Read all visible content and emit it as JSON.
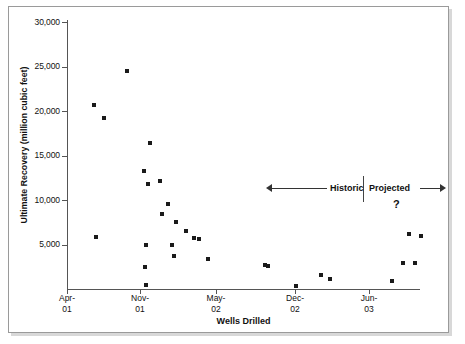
{
  "chart_data": {
    "type": "scatter",
    "title": "",
    "xlabel": "Wells Drilled",
    "ylabel": "Ultimate Recovery (million cubic feet)",
    "ylim": [
      0,
      30000
    ],
    "ytick_labels": [
      "30,000",
      "25,000",
      "20,000",
      "15,000",
      "10,000",
      "5,000"
    ],
    "ytick_values": [
      30000,
      25000,
      20000,
      15000,
      10000,
      5000
    ],
    "xtick_labels": [
      {
        "line1": "Apr-",
        "line2": "01"
      },
      {
        "line1": "Nov-",
        "line2": "01"
      },
      {
        "line1": "May-",
        "line2": "02"
      },
      {
        "line1": "Dec-",
        "line2": "02"
      },
      {
        "line1": "Jun-",
        "line2": "03"
      }
    ],
    "grid": false,
    "legend": null,
    "series": [
      {
        "name": "Ultimate Recovery per well",
        "points": [
          {
            "x_px": 94,
            "value": 20700
          },
          {
            "x_px": 104,
            "value": 19200
          },
          {
            "x_px": 127,
            "value": 24500
          },
          {
            "x_px": 96,
            "value": 5800
          },
          {
            "x_px": 150,
            "value": 16400
          },
          {
            "x_px": 144,
            "value": 13300
          },
          {
            "x_px": 148,
            "value": 11800
          },
          {
            "x_px": 160,
            "value": 12100
          },
          {
            "x_px": 146,
            "value": 5000
          },
          {
            "x_px": 145,
            "value": 2500
          },
          {
            "x_px": 146,
            "value": 400
          },
          {
            "x_px": 168,
            "value": 9500
          },
          {
            "x_px": 162,
            "value": 8400
          },
          {
            "x_px": 172,
            "value": 5000
          },
          {
            "x_px": 176,
            "value": 7500
          },
          {
            "x_px": 174,
            "value": 3700
          },
          {
            "x_px": 186,
            "value": 6500
          },
          {
            "x_px": 194,
            "value": 5700
          },
          {
            "x_px": 199,
            "value": 5600
          },
          {
            "x_px": 208,
            "value": 3400
          },
          {
            "x_px": 265,
            "value": 2700
          },
          {
            "x_px": 268,
            "value": 2600
          },
          {
            "x_px": 296,
            "value": 300
          },
          {
            "x_px": 321,
            "value": 1600
          },
          {
            "x_px": 330,
            "value": 1100
          },
          {
            "x_px": 392,
            "value": 900
          },
          {
            "x_px": 403,
            "value": 2900
          },
          {
            "x_px": 415,
            "value": 2900
          },
          {
            "x_px": 409,
            "value": 6200
          },
          {
            "x_px": 421,
            "value": 6000
          }
        ]
      }
    ],
    "annotations": {
      "historic_label": "Historic",
      "projected_label": "Projected",
      "question_mark": "?"
    }
  }
}
